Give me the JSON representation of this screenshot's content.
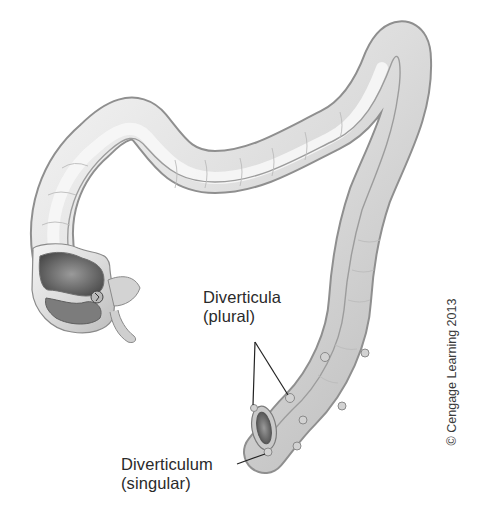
{
  "figure": {
    "labels": {
      "diverticula": {
        "term": "Diverticula",
        "note": "(plural)"
      },
      "diverticulum": {
        "term": "Diverticulum",
        "note": "(singular)"
      }
    },
    "credit": "© Cengage Learning 2013"
  },
  "colors": {
    "background": "#ffffff",
    "tissue_light": "#ececec",
    "tissue_mid": "#cfcfcf",
    "tissue_dark": "#8a8a8a",
    "lumen_dark": "#555555",
    "text": "#2a2a2a",
    "leader_line": "#222222"
  }
}
